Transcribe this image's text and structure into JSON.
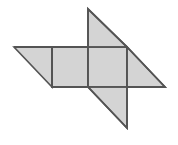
{
  "figure": {
    "name": "pinwheel-polygon-figure",
    "canvas": {
      "width": 178,
      "height": 145,
      "background": "#ffffff"
    },
    "style": {
      "fill": "#d4d4d4",
      "stroke": "#545454",
      "stroke_width": 1.6,
      "inner_stroke": "#545454",
      "inner_stroke_width": 1.6
    },
    "parts": [
      {
        "id": "center-square-left-half",
        "label": "center-square-left-half",
        "type": "square-half",
        "points": "52,47 88,47 88,87 52,87"
      },
      {
        "id": "center-square-right-half",
        "label": "center-square-right-half",
        "type": "square-half",
        "points": "88,47 127,47 127,87 88,87"
      },
      {
        "id": "left-triangle",
        "label": "left-triangle",
        "type": "right-triangle",
        "points": "14,47 52,47 52,87"
      },
      {
        "id": "top-triangle",
        "label": "top-triangle",
        "type": "right-triangle",
        "points": "88,9 127,47 88,47"
      },
      {
        "id": "right-triangle",
        "label": "right-triangle",
        "type": "right-triangle",
        "points": "127,47 165,87 127,87"
      },
      {
        "id": "bottom-triangle",
        "label": "bottom-triangle",
        "type": "right-triangle",
        "points": "88,87 127,87 127,128"
      }
    ],
    "outline": "14,47 52,47 88,47 88,9 127,47 165,87 127,87 127,128 88,87 52,87 52,47",
    "inner_edges": [
      {
        "id": "inner-edge-vertical-left",
        "x1": 52,
        "y1": 47,
        "x2": 52,
        "y2": 87
      },
      {
        "id": "inner-edge-vertical-mid",
        "x1": 88,
        "y1": 47,
        "x2": 88,
        "y2": 87
      },
      {
        "id": "inner-edge-vertical-right",
        "x1": 127,
        "y1": 47,
        "x2": 127,
        "y2": 87
      },
      {
        "id": "inner-edge-horizontal-top",
        "x1": 52,
        "y1": 47,
        "x2": 127,
        "y2": 47
      },
      {
        "id": "inner-edge-horizontal-bottom",
        "x1": 52,
        "y1": 87,
        "x2": 127,
        "y2": 87
      }
    ]
  }
}
